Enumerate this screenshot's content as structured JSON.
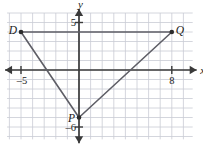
{
  "figure": {
    "name": "coordinate-plane-angle-dpq",
    "width": 203,
    "height": 153,
    "background_color": "#ffffff"
  },
  "axes": {
    "x_axis_label": "x",
    "y_axis_label": "y",
    "axis_color": "#3a3a3a",
    "grid_color": "#c9cbd4",
    "origin_px": {
      "x": 79,
      "y": 70
    },
    "unit_px": {
      "x": 11.6,
      "y": 9.5
    },
    "x_range": [
      -6.2,
      9.8
    ],
    "y_range": [
      -7.3,
      6.0
    ],
    "tick_labels": [
      {
        "name": "x-tick-neg5",
        "text": "–5",
        "value": -5,
        "axis": "x"
      },
      {
        "name": "x-tick-8",
        "text": "8",
        "value": 8,
        "axis": "x"
      },
      {
        "name": "y-tick-5",
        "text": "5",
        "value": 5,
        "axis": "y"
      },
      {
        "name": "y-tick-neg6",
        "text": "–6",
        "value": -6,
        "axis": "y"
      }
    ]
  },
  "chart_data": {
    "type": "scatter",
    "title": "",
    "xlabel": "x",
    "ylabel": "y",
    "xlim": [
      -6.2,
      9.8
    ],
    "ylim": [
      -7.3,
      6.0
    ],
    "grid": true,
    "legend": "none",
    "points": [
      {
        "label": "D",
        "x": -5,
        "y": 4
      },
      {
        "label": "P",
        "x": 0,
        "y": -5
      },
      {
        "label": "Q",
        "x": 8,
        "y": 4
      }
    ],
    "segments": [
      {
        "name": "segment-d-q",
        "from": "D",
        "to": "Q",
        "color": "#5e5e66"
      },
      {
        "name": "ray-p-d",
        "from": "P",
        "to": "D",
        "color": "#5e5e66"
      },
      {
        "name": "ray-p-q",
        "from": "P",
        "to": "Q",
        "color": "#5e5e66"
      }
    ]
  },
  "labels": {
    "point_d": "D",
    "point_p": "P",
    "point_q": "Q",
    "axis_x": "x",
    "axis_y": "y",
    "tick_neg5": "–5",
    "tick_8": "8",
    "tick_5": "5",
    "tick_neg6": "–6"
  },
  "colors": {
    "grid": "#c9cbd4",
    "axis": "#3a3a3a",
    "segment": "#5e5e66",
    "point_marker": "#2b2b2b",
    "text": "#1a1a1a",
    "background": "#ffffff"
  }
}
